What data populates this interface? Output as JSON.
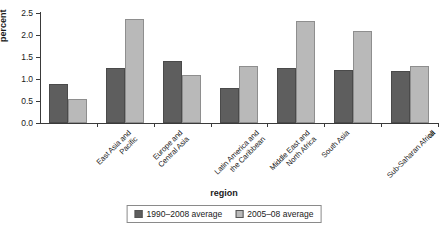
{
  "chart_data": {
    "type": "bar",
    "title": "",
    "xlabel": "region",
    "ylabel": "percent",
    "ylim": [
      0.0,
      2.5
    ],
    "yticks": [
      "0.0",
      "0.5",
      "1.0",
      "1.5",
      "2.0",
      "2.5"
    ],
    "ytick_values": [
      0.0,
      0.5,
      1.0,
      1.5,
      2.0,
      2.5
    ],
    "grid": false,
    "legend_position": "bottom-center",
    "categories": [
      "East Asia and Pacific",
      "Europe and Central Asia",
      "Latin America and the Caribbean",
      "Middle East and North Africa",
      "South Asia",
      "Sub-Saharan Africa",
      "all"
    ],
    "category_lines": [
      [
        "East Asia and",
        "Pacific"
      ],
      [
        "Europe and",
        "Central Asia"
      ],
      [
        "Latin America and",
        "the Caribbean"
      ],
      [
        "Middle East and",
        "North Africa"
      ],
      [
        "South Asia"
      ],
      [
        "Sub-Saharan Africa"
      ],
      [
        "all"
      ]
    ],
    "series": [
      {
        "name": "1990–2008 average",
        "color": "#5e5e5e",
        "values": [
          0.89,
          1.25,
          1.42,
          0.8,
          1.25,
          1.2,
          1.18
        ]
      },
      {
        "name": "2005–08 average",
        "color": "#b9b9b9",
        "values": [
          0.54,
          2.36,
          1.08,
          1.3,
          2.32,
          2.1,
          1.3
        ]
      }
    ]
  },
  "legend": {
    "items": [
      {
        "label": "1990–2008 average"
      },
      {
        "label": "2005–08 average"
      }
    ]
  },
  "colors": {
    "series_0": "#5e5e5e",
    "series_1": "#b9b9b9",
    "axis": "#3a3a3a",
    "background": "#ffffff"
  }
}
